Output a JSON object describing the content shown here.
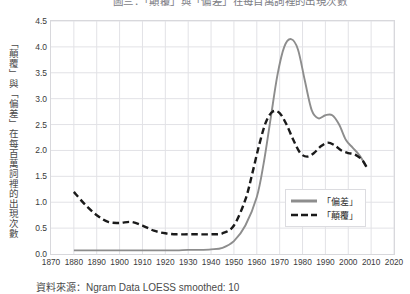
{
  "chart_data": {
    "type": "line",
    "title": "圖三：「顛覆」與「偏差」在每百萬詞裡的出現次數",
    "xlabel": "",
    "ylabel": "「顛覆」與「偏差」在每百萬詞裡的出現次數",
    "xlim": [
      1870,
      2020
    ],
    "ylim": [
      0.0,
      4.5
    ],
    "grid": true,
    "legend_position": "center-right",
    "xticks": [
      1870,
      1880,
      1890,
      1900,
      1910,
      1920,
      1930,
      1940,
      1950,
      1960,
      1970,
      1980,
      1990,
      2000,
      2010,
      2020
    ],
    "yticks": [
      "0.0",
      "0.5",
      "1.0",
      "1.5",
      "2.0",
      "2.5",
      "3.0",
      "3.5",
      "4.0",
      "4.5"
    ],
    "source_note": "資料來源：Ngram Data LOESS smoothed: 10",
    "series": [
      {
        "name": "「偏差」",
        "style": "solid",
        "color": "#8d8d8d",
        "x": [
          1880,
          1885,
          1890,
          1895,
          1900,
          1905,
          1910,
          1915,
          1920,
          1925,
          1930,
          1935,
          1940,
          1945,
          1950,
          1955,
          1960,
          1963,
          1966,
          1969,
          1972,
          1975,
          1978,
          1981,
          1984,
          1987,
          1990,
          1993,
          1996,
          1999,
          2002,
          2005,
          2008
        ],
        "values": [
          0.07,
          0.07,
          0.07,
          0.07,
          0.07,
          0.07,
          0.07,
          0.07,
          0.07,
          0.07,
          0.08,
          0.08,
          0.09,
          0.12,
          0.25,
          0.55,
          1.1,
          1.75,
          2.6,
          3.45,
          4.0,
          4.15,
          3.95,
          3.35,
          2.78,
          2.62,
          2.68,
          2.68,
          2.5,
          2.2,
          2.05,
          1.9,
          1.68
        ]
      },
      {
        "name": "「顛覆」",
        "style": "dashed",
        "color": "#1a1a1a",
        "x": [
          1880,
          1885,
          1890,
          1895,
          1900,
          1905,
          1910,
          1915,
          1920,
          1925,
          1930,
          1935,
          1940,
          1945,
          1950,
          1955,
          1958,
          1961,
          1964,
          1967,
          1970,
          1973,
          1976,
          1979,
          1982,
          1985,
          1988,
          1991,
          1994,
          1997,
          2000,
          2003,
          2006,
          2008
        ],
        "values": [
          1.2,
          0.95,
          0.75,
          0.62,
          0.6,
          0.62,
          0.55,
          0.45,
          0.4,
          0.38,
          0.38,
          0.38,
          0.38,
          0.4,
          0.55,
          1.05,
          1.55,
          2.1,
          2.55,
          2.75,
          2.72,
          2.5,
          2.2,
          1.95,
          1.88,
          1.95,
          2.08,
          2.15,
          2.1,
          2.0,
          1.95,
          1.92,
          1.82,
          1.68
        ]
      }
    ]
  }
}
